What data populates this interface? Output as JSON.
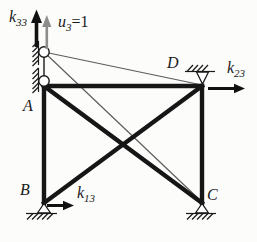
{
  "figure": {
    "background": "#fcfcfb",
    "colors": {
      "member": "#161616",
      "displaced_line": "#5c5c5c",
      "displacement_arrow": "#8d8d8d",
      "support": "#1a1a1a"
    },
    "labels": {
      "k33": {
        "base": "k",
        "sub": "33"
      },
      "u3": {
        "base": "u",
        "sub": "3",
        "suffix": "=1"
      },
      "k23": {
        "base": "k",
        "sub": "23"
      },
      "k13": {
        "base": "k",
        "sub": "13"
      },
      "node_a": "A",
      "node_b": "B",
      "node_c": "C",
      "node_d": "D"
    },
    "nodes": [
      {
        "label": "A",
        "x": 44,
        "y": 86,
        "support": "roller-on-left-wall"
      },
      {
        "label": "B",
        "x": 44,
        "y": 203,
        "support": "pin-at-base"
      },
      {
        "label": "C",
        "x": 202,
        "y": 203,
        "support": "pin-at-base"
      },
      {
        "label": "D",
        "x": 202,
        "y": 86,
        "support": "roller-from-above"
      }
    ],
    "members": [
      "A-D",
      "A-B",
      "D-C",
      "A-C",
      "B-D"
    ],
    "displacement": {
      "node": "A",
      "direction": "up",
      "value": "u3 = 1"
    },
    "forces": [
      {
        "label": "k33",
        "at": "A",
        "direction": "up"
      },
      {
        "label": "k23",
        "at": "D",
        "direction": "right"
      },
      {
        "label": "k13",
        "at": "B",
        "direction": "right"
      }
    ],
    "displaced_shape_lines": [
      "A'-D",
      "A'-C"
    ]
  }
}
